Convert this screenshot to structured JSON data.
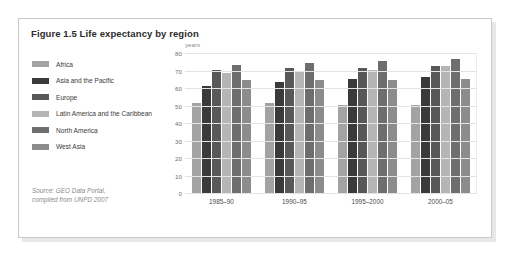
{
  "figure": {
    "title": "Figure 1.5 Life expectancy by region",
    "source_line1": "Source: GEO Data Portal,",
    "source_line2": "compiled from UNPD 2007"
  },
  "colors": {
    "africa": "#a3a3a3",
    "asia_pacific": "#3a3a3a",
    "europe": "#585858",
    "latin_america": "#b5b5b5",
    "north_america": "#6e6e6e",
    "west_asia": "#8c8c8c",
    "grid": "#e4e4e4",
    "axis": "#bdbdbd",
    "card_border": "#c9c9c9"
  },
  "chart_data": {
    "type": "bar",
    "title": "Figure 1.5 Life expectancy by region",
    "xlabel": "",
    "ylabel": "years",
    "ylim": [
      0,
      80
    ],
    "yticks": [
      0,
      10,
      20,
      30,
      40,
      50,
      60,
      70,
      80
    ],
    "grid": true,
    "legend_position": "left",
    "categories": [
      "1985–90",
      "1990–95",
      "1995–2000",
      "2000–05"
    ],
    "series": [
      {
        "name": "Africa",
        "values": [
          52,
          52,
          51,
          51
        ]
      },
      {
        "name": "Asia and the Pacific",
        "values": [
          62,
          64,
          66,
          67
        ]
      },
      {
        "name": "Europe",
        "values": [
          71,
          72,
          72,
          73
        ]
      },
      {
        "name": "Latin America and the Caribbean",
        "values": [
          69,
          70,
          71,
          73
        ]
      },
      {
        "name": "North America",
        "values": [
          74,
          75,
          76,
          77
        ]
      },
      {
        "name": "West Asia",
        "values": [
          65,
          65,
          65,
          66
        ]
      }
    ]
  }
}
